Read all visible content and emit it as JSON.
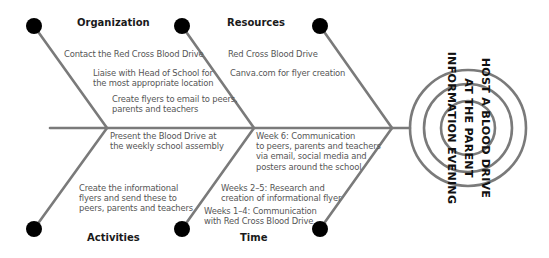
{
  "diagram": {
    "type": "fishbone",
    "colors": {
      "line": "#7a7a7a",
      "dot": "#000000",
      "heading": "#1a1a1a",
      "text": "#555555"
    },
    "goal": {
      "lines": [
        "HOST A BLOOD DRIVE",
        "AT THE PARENT",
        "INFORMATION EVENING"
      ]
    },
    "categories": {
      "organization": {
        "heading": "Organization",
        "items": [
          "Contact the Red Cross Blood Drive",
          "Liaise with Head of School for",
          "the most appropriate location",
          "Create flyers to email to peers,",
          "parents and teachers"
        ]
      },
      "resources": {
        "heading": "Resources",
        "items": [
          "Red Cross Blood Drive",
          "Canva.com for flyer creation"
        ]
      },
      "activities": {
        "heading": "Activities",
        "items": [
          "Present the Blood Drive at",
          "the weekly school assembly",
          "Create the informational",
          "flyers and send these to",
          "peers, parents and teachers"
        ]
      },
      "time": {
        "heading": "Time",
        "items": [
          "Week 6: Communication",
          "to peers, parents and teachers",
          "via email, social media and",
          "posters around the school",
          "Weeks 2–5: Research and",
          "creation of informational flyer",
          "Weeks 1–4: Communication",
          "with Red Cross Blood Drive"
        ]
      }
    }
  }
}
